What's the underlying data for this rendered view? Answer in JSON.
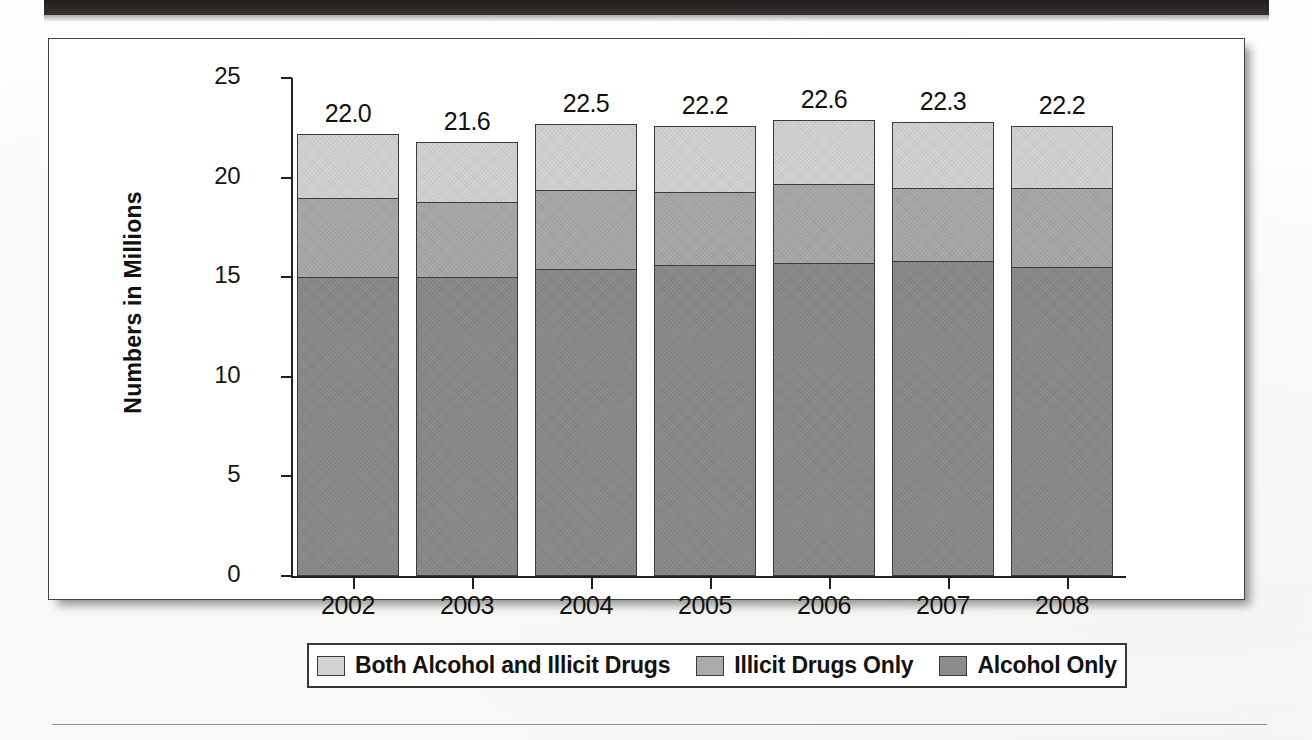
{
  "page": {
    "top_band": "",
    "bottom_rule": ""
  },
  "chart_data": {
    "type": "bar",
    "subtype": "stacked-bar",
    "title": "",
    "xlabel": "",
    "ylabel": "Numbers in Millions",
    "ylim": [
      0,
      25
    ],
    "yticks": [
      "0",
      "5",
      "10",
      "15",
      "20",
      "25"
    ],
    "grid": false,
    "legend_position": "bottom",
    "categories": [
      "2002",
      "2003",
      "2004",
      "2005",
      "2006",
      "2007",
      "2008"
    ],
    "totals": [
      "22.0",
      "21.6",
      "22.5",
      "22.2",
      "22.6",
      "22.3",
      "22.2"
    ],
    "series": [
      {
        "name": "Alcohol Only",
        "color": "#8c8c8a",
        "values": [
          15.0,
          15.0,
          15.4,
          15.6,
          15.7,
          15.8,
          15.5
        ]
      },
      {
        "name": "Illicit Drugs Only",
        "color": "#aaaaa8",
        "values": [
          4.0,
          3.8,
          4.0,
          3.7,
          4.0,
          3.7,
          4.0
        ]
      },
      {
        "name": "Both Alcohol and Illicit Drugs",
        "color": "#d3d3d1",
        "values": [
          3.2,
          3.0,
          3.3,
          3.3,
          3.2,
          3.3,
          3.1
        ]
      }
    ],
    "legend": [
      {
        "label": "Both Alcohol and Illicit Drugs",
        "color": "#d3d3d1"
      },
      {
        "label": "Illicit Drugs Only",
        "color": "#aaaaa8"
      },
      {
        "label": "Alcohol Only",
        "color": "#8c8c8a"
      }
    ]
  }
}
